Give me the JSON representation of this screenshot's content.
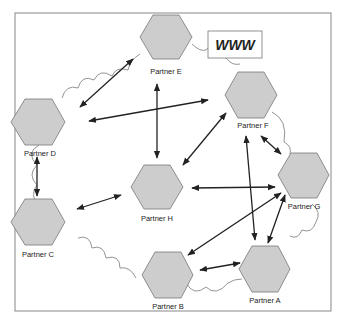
{
  "diagram": {
    "title": "",
    "internet_label": "WWW",
    "colors": {
      "node_fill": "#cccccc",
      "node_stroke": "#777777",
      "arrow": "#222222",
      "frame": "#888888",
      "cloud": "#666666"
    },
    "nodes": [
      {
        "id": "E",
        "label": "Partner E"
      },
      {
        "id": "D",
        "label": "Partner D"
      },
      {
        "id": "F",
        "label": "Partner F"
      },
      {
        "id": "H",
        "label": "Partner H"
      },
      {
        "id": "G",
        "label": "Partner G"
      },
      {
        "id": "C",
        "label": "Partner C"
      },
      {
        "id": "B",
        "label": "Partner B"
      },
      {
        "id": "A",
        "label": "Partner A"
      }
    ],
    "connections": [
      {
        "from": "E",
        "to": "D",
        "type": "bidirectional"
      },
      {
        "from": "E",
        "to": "H",
        "type": "bidirectional"
      },
      {
        "from": "F",
        "to": "D",
        "type": "bidirectional"
      },
      {
        "from": "D",
        "to": "C",
        "type": "bidirectional"
      },
      {
        "from": "F",
        "to": "H",
        "type": "bidirectional"
      },
      {
        "from": "F",
        "to": "G",
        "type": "bidirectional"
      },
      {
        "from": "F",
        "to": "A",
        "type": "bidirectional"
      },
      {
        "from": "H",
        "to": "C",
        "type": "bidirectional"
      },
      {
        "from": "H",
        "to": "G",
        "type": "bidirectional"
      },
      {
        "from": "G",
        "to": "B",
        "type": "bidirectional"
      },
      {
        "from": "G",
        "to": "A",
        "type": "bidirectional"
      },
      {
        "from": "B",
        "to": "A",
        "type": "bidirectional"
      }
    ]
  }
}
